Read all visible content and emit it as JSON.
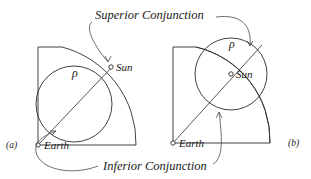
{
  "figure": {
    "title_superior": "Superior Conjunction",
    "title_inferior": "Inferior Conjunction",
    "panels": [
      {
        "id": "a",
        "label": "(a)",
        "earth_label": "Earth",
        "sun_label": "Sun",
        "rho_label": "ρ",
        "description": "Superior conjunction configuration: epicycle circle centered on the Earth-Sun line with the Sun marker on the far side of the deferent arc."
      },
      {
        "id": "b",
        "label": "(b)",
        "earth_label": "Earth",
        "sun_label": "Sun",
        "rho_label": "ρ",
        "description": "Inferior conjunction configuration: epicycle circle with the Sun marker at the circle center on the Earth-Sun line."
      }
    ],
    "colors": {
      "ink": "#2b2b2b",
      "leader": "#4a4a4a",
      "background": "#ffffff",
      "marker_fill": "#ffffff"
    }
  }
}
